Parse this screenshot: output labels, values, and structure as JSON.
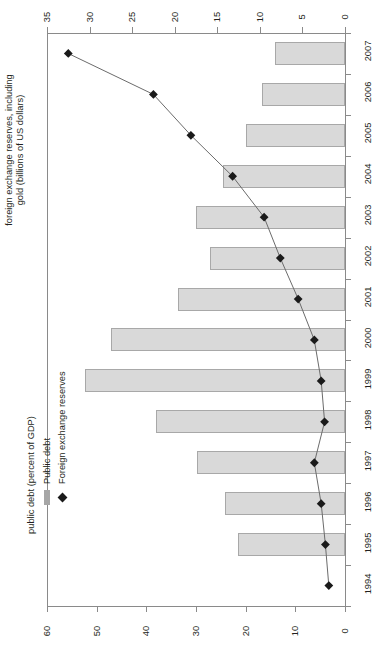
{
  "axes": {
    "reserves_title": "foreign exchange reserves, including",
    "reserves_title_line2": "gold (billions of US dollars)",
    "debt_title": "public debt (percent of GDP)",
    "reserves_ticks": [
      "35",
      "30",
      "25",
      "20",
      "15",
      "10",
      "5",
      "0"
    ],
    "debt_ticks": [
      "60",
      "50",
      "40",
      "30",
      "20",
      "10",
      "0"
    ]
  },
  "legend": {
    "public_debt": "Public debt",
    "reserves": "Foreign exchange reserves",
    "bar_color": "#d9d9d9",
    "marker_color": "#1a1a1a"
  },
  "chart_data": {
    "type": "bar",
    "title": "",
    "orientation": "horizontal",
    "categories": [
      "2007",
      "2006",
      "2005",
      "2004",
      "2003",
      "2002",
      "2001",
      "2000",
      "1999",
      "1998",
      "1997",
      "1996",
      "1995",
      "1994"
    ],
    "xlabel": "public debt (percent of GDP)",
    "ylabel": "",
    "xlim": [
      0,
      60
    ],
    "secondary_xlabel": "foreign exchange reserves, including gold (billions of US dollars)",
    "secondary_xlim": [
      0,
      35
    ],
    "grid": false,
    "legend_position": "bottom-left",
    "series": [
      {
        "name": "Public debt",
        "unit": "percent of GDP",
        "type": "bar",
        "color": "#d9d9d9",
        "values": [
          14.1,
          16.7,
          19.9,
          24.6,
          30.0,
          27.1,
          33.6,
          47.2,
          52.4,
          38.0,
          29.8,
          24.2,
          21.6,
          0
        ]
      },
      {
        "name": "Foreign exchange reserves",
        "unit": "billions of US dollars",
        "type": "line",
        "color": "#1a1a1a",
        "values": [
          32.5,
          22.5,
          18.1,
          13.2,
          9.5,
          7.6,
          5.5,
          3.6,
          2.8,
          2.4,
          3.6,
          2.8,
          2.3,
          1.9
        ]
      }
    ]
  }
}
